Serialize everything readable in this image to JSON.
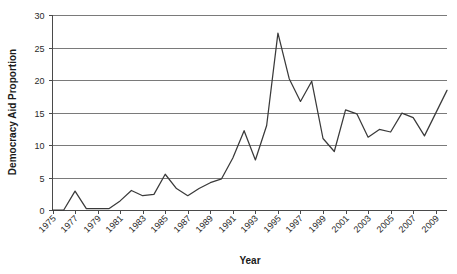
{
  "chart_data": {
    "type": "line",
    "title": "",
    "subtitle": "",
    "xlabel": "Year",
    "ylabel": "Democracy Aid Proportion",
    "xlim": [
      1975,
      2010
    ],
    "ylim": [
      0,
      30
    ],
    "yticks": [
      0,
      5,
      10,
      15,
      20,
      25,
      30
    ],
    "ytick_labels": [
      "0",
      "5",
      "10",
      "15",
      "20",
      "25",
      "30"
    ],
    "xticks": [
      1975,
      1977,
      1979,
      1981,
      1983,
      1985,
      1987,
      1989,
      1991,
      1993,
      1995,
      1997,
      1999,
      2001,
      2003,
      2005,
      2007,
      2009
    ],
    "xtick_labels": [
      "1975",
      "1977",
      "1979",
      "1981",
      "1983",
      "1985",
      "1987",
      "1989",
      "1991",
      "1993",
      "1995",
      "1997",
      "1999",
      "2001",
      "2003",
      "2005",
      "2007",
      "2009"
    ],
    "xtick_rotation": 45,
    "grid": "horizontal",
    "legend": "none",
    "line_color": "#3a3a3a",
    "grid_color": "#7a7a7a",
    "axis_color": "#4a4a4a",
    "background_color": "#ffffff",
    "x": [
      1975,
      1976,
      1977,
      1978,
      1979,
      1980,
      1981,
      1982,
      1983,
      1984,
      1985,
      1986,
      1987,
      1988,
      1989,
      1990,
      1991,
      1992,
      1993,
      1994,
      1995,
      1996,
      1997,
      1998,
      1999,
      2000,
      2001,
      2002,
      2003,
      2004,
      2005,
      2006,
      2007,
      2008,
      2009,
      2010
    ],
    "values": [
      0.0,
      0.0,
      2.9,
      0.2,
      0.2,
      0.2,
      1.4,
      3.0,
      2.2,
      2.4,
      5.5,
      3.3,
      2.2,
      3.3,
      4.2,
      4.8,
      8.0,
      12.2,
      7.7,
      13.0,
      27.2,
      20.2,
      16.7,
      19.8,
      11.0,
      9.0,
      15.4,
      14.8,
      11.2,
      12.4,
      12.0,
      14.9,
      14.2,
      11.4,
      14.9,
      18.4
    ]
  },
  "axis": {
    "y_title": "Democracy Aid Proportion",
    "x_title": "Year"
  }
}
